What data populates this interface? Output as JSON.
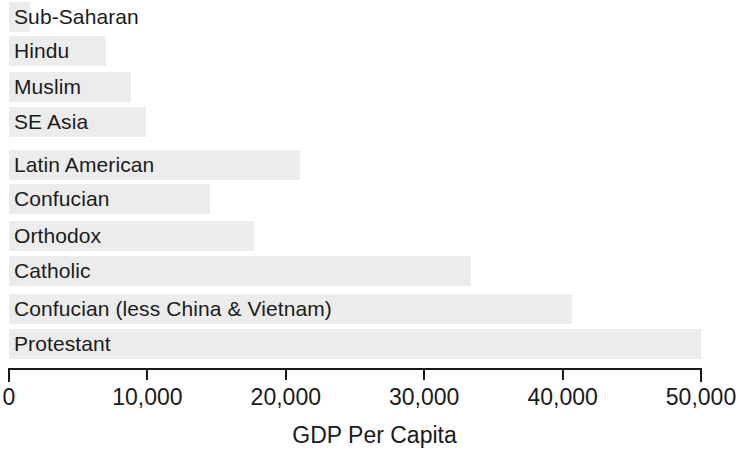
{
  "chart_data": {
    "type": "bar",
    "orientation": "horizontal",
    "title": "",
    "xlabel": "GDP Per Capita",
    "ylabel": "",
    "xlim": [
      0,
      50000
    ],
    "grid": false,
    "legend": false,
    "bar_color": "#ececec",
    "axis_color": "#1a1a1a",
    "text_color": "#1a1a1a",
    "x_ticks": [
      0,
      10000,
      20000,
      30000,
      40000,
      50000
    ],
    "x_tick_labels": [
      "0",
      "10,000",
      "20,000",
      "30,000",
      "40,000",
      "50,000"
    ],
    "categories": [
      "Sub-Saharan",
      "Hindu",
      "Muslim",
      "SE Asia",
      "Latin American",
      "Confucian",
      "Orthodox",
      "Catholic",
      "Confucian (less China & Vietnam)",
      "Protestant"
    ],
    "values": [
      1500,
      7000,
      8800,
      9900,
      21000,
      14500,
      17700,
      33400,
      40700,
      50000
    ]
  }
}
